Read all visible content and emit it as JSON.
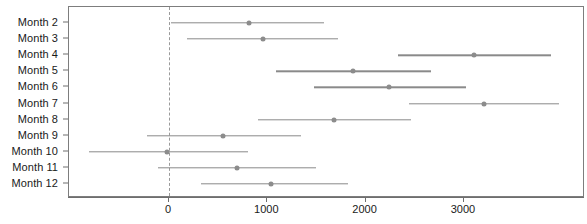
{
  "chart_data": {
    "type": "scatter",
    "subtype": "forest-plot",
    "title": "",
    "xlabel": "",
    "ylabel": "",
    "xlim": [
      -900,
      4100
    ],
    "xticks": [
      0,
      1000,
      2000,
      3000
    ],
    "xtick_labels": [
      "0",
      "1000",
      "2000",
      "3000"
    ],
    "grid": false,
    "legend": false,
    "reference_line": 0,
    "reference_line_style": "dashed",
    "categories": [
      "Month  2",
      "Month  3",
      "Month  4",
      "Month  5",
      "Month  6",
      "Month  7",
      "Month  8",
      "Month  9",
      "Month  10",
      "Month  11",
      "Month  12"
    ],
    "points": [
      {
        "label": "Month  2",
        "estimate": 815,
        "low": 20,
        "high": 1575
      },
      {
        "label": "Month  3",
        "estimate": 955,
        "low": 180,
        "high": 1715
      },
      {
        "label": "Month  4",
        "estimate": 3100,
        "low": 2330,
        "high": 3885
      },
      {
        "label": "Month  5",
        "estimate": 1870,
        "low": 1090,
        "high": 2665
      },
      {
        "label": "Month  6",
        "estimate": 2240,
        "low": 1475,
        "high": 3020
      },
      {
        "label": "Month  7",
        "estimate": 3200,
        "low": 2440,
        "high": 3965
      },
      {
        "label": "Month  8",
        "estimate": 1680,
        "low": 905,
        "high": 2460
      },
      {
        "label": "Month  9",
        "estimate": 550,
        "low": -225,
        "high": 1340
      },
      {
        "label": "Month  10",
        "estimate": -20,
        "low": -815,
        "high": 805
      },
      {
        "label": "Month  11",
        "estimate": 690,
        "low": -110,
        "high": 1495
      },
      {
        "label": "Month  12",
        "estimate": 1035,
        "low": 325,
        "high": 1820
      }
    ],
    "colors": {
      "point": "#8c8c8c",
      "interval": "#8a8a8a",
      "reference_line": "#9a9a9a",
      "axis": "#6e6e6e",
      "text": "#1a1a1a",
      "background": "#ffffff"
    }
  }
}
